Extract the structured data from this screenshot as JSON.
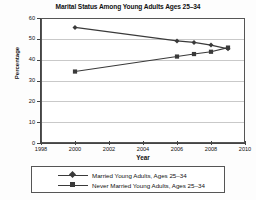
{
  "chart_data": {
    "type": "line",
    "title": "Marital Status Among Young Adults Ages 25–34",
    "xlabel": "Year",
    "ylabel": "Percentage",
    "xlim": [
      1998,
      2010
    ],
    "ylim": [
      0,
      60
    ],
    "xticks": [
      1998,
      2000,
      2002,
      2004,
      2006,
      2008,
      2010
    ],
    "yticks": [
      0,
      10,
      20,
      30,
      40,
      50,
      60
    ],
    "grid": true,
    "legend_position": "bottom",
    "series": [
      {
        "name": "Married Young Adults, Ages 25–34",
        "marker": "diamond",
        "color": "#3a3a3a",
        "x": [
          2000,
          2006,
          2007,
          2008,
          2009
        ],
        "values": [
          55.5,
          49.0,
          48.3,
          47.0,
          45.2
        ]
      },
      {
        "name": "Never Married Young Adults, Ages 25–34",
        "marker": "square",
        "color": "#3a3a3a",
        "x": [
          2000,
          2006,
          2007,
          2008,
          2009
        ],
        "values": [
          34.3,
          41.5,
          42.7,
          43.8,
          45.8
        ]
      }
    ]
  },
  "legend": {
    "items": [
      {
        "label": "Married Young Adults, Ages 25–34",
        "marker": "diamond"
      },
      {
        "label": "Never Married Young Adults, Ages 25–34",
        "marker": "square"
      }
    ]
  }
}
